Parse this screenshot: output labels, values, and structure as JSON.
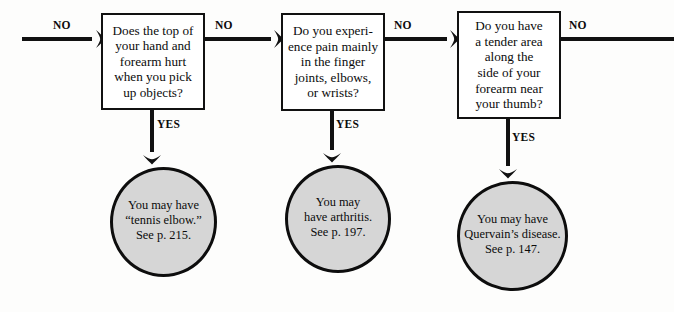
{
  "diagram": {
    "type": "decision-flowchart",
    "background_color": "#fdfdfc",
    "line_color": "#111111",
    "box_fill": "#ffffff",
    "circle_fill": "#d6d6d6",
    "text_color": "#0b0b0b"
  },
  "decisions": [
    {
      "id": "box-1",
      "text": "Does the top of\nyour hand and\nforearm hurt\nwhen you pick\nup objects?",
      "no_label": "NO",
      "yes_label": "YES"
    },
    {
      "id": "box-2",
      "text": "Do you experi-\nence pain mainly\nin the finger\njoints, elbows,\nor wrists?",
      "no_label": "NO",
      "yes_label": "YES"
    },
    {
      "id": "box-3",
      "text": "Do you have\na tender area\nalong the\nside of your\nforearm near\nyour thumb?",
      "no_label": "NO",
      "yes_label": "YES"
    }
  ],
  "entry": {
    "label": "NO"
  },
  "exit": {
    "label": "NO"
  },
  "outcomes": [
    {
      "id": "circle-1",
      "text": "You may have\n“tennis elbow.”\nSee p. 215.",
      "condition": "tennis elbow",
      "page_reference": "215"
    },
    {
      "id": "circle-2",
      "text": "You may\nhave arthritis.\nSee p. 197.",
      "condition": "arthritis",
      "page_reference": "197"
    },
    {
      "id": "circle-3",
      "text": "You may have\nQuervain’s disease.\nSee p. 147.",
      "condition": "Quervain’s disease",
      "page_reference": "147"
    }
  ]
}
